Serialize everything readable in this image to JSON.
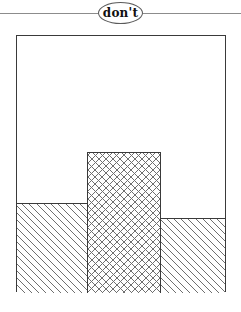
{
  "header": {
    "rule": "horizontal-divider",
    "badge_label": "don't"
  },
  "figure": {
    "caption": "",
    "frame": {
      "name": "outer-rectangle",
      "fill": "#ffffff",
      "stroke": "#3a3a3a"
    },
    "regions": [
      {
        "name": "left-hatched-region",
        "fill_pattern": "diagonal-hatch-45",
        "stroke": "#3a3a3a",
        "label": ""
      },
      {
        "name": "center-crosshatched-column",
        "fill_pattern": "cross-hatch",
        "stroke": "#3a3a3a",
        "label": ""
      },
      {
        "name": "right-hatched-region",
        "fill_pattern": "diagonal-hatch-45",
        "stroke": "#3a3a3a",
        "label": ""
      }
    ]
  },
  "colors": {
    "page_background": "#ffffff",
    "line": "#3a3a3a",
    "rule": "#8c8c8c",
    "hatch": "#6f6f6f",
    "text": "#111111"
  }
}
